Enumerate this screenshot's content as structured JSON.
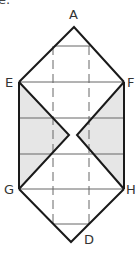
{
  "corner_label": "e.",
  "labels": {
    "A": "A",
    "E": "E",
    "F": "F",
    "G": "G",
    "H": "H",
    "D": "D"
  },
  "colors": {
    "stroke": "#1a1a1a",
    "thin": "#555555",
    "shade": "#e6e6e6",
    "label": "#333333"
  }
}
